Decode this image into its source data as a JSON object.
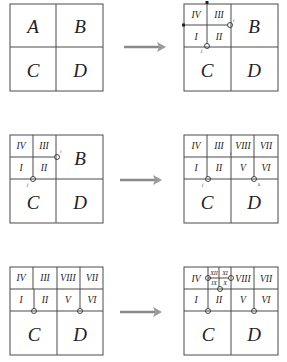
{
  "panels": {
    "p1_left": {
      "A": "A",
      "B": "B",
      "C": "C",
      "D": "D"
    },
    "p1_right": {
      "IV": "IV",
      "III": "III",
      "I": "I",
      "II": "II",
      "B": "B",
      "C": "C",
      "D": "D",
      "mark_i": "i",
      "mark_j": "j"
    },
    "p2_left": {
      "IV": "IV",
      "III": "III",
      "I": "I",
      "II": "II",
      "B": "B",
      "C": "C",
      "D": "D",
      "mark_i": "i",
      "mark_j": "j"
    },
    "p2_right": {
      "IV": "IV",
      "III": "III",
      "VIII": "VIII",
      "VII": "VII",
      "I": "I",
      "II": "II",
      "V": "V",
      "VI": "VI",
      "C": "C",
      "D": "D",
      "mark_i": "i",
      "mark_j": "j",
      "mark_k": "k"
    },
    "p3_left": {
      "IV": "IV",
      "III": "III",
      "VIII": "VIII",
      "VII": "VII",
      "I": "I",
      "II": "II",
      "V": "V",
      "VI": "VI",
      "C": "C",
      "D": "D"
    },
    "p3_right": {
      "IV": "IV",
      "XII": "XII",
      "XI": "XI",
      "IX": "IX",
      "X": "X",
      "VIII": "VIII",
      "VII": "VII",
      "I": "I",
      "II": "II",
      "V": "V",
      "VI": "VI",
      "C": "C",
      "D": "D"
    }
  },
  "arrows": [
    "row1-arrow",
    "row2-arrow",
    "row3-arrow"
  ]
}
